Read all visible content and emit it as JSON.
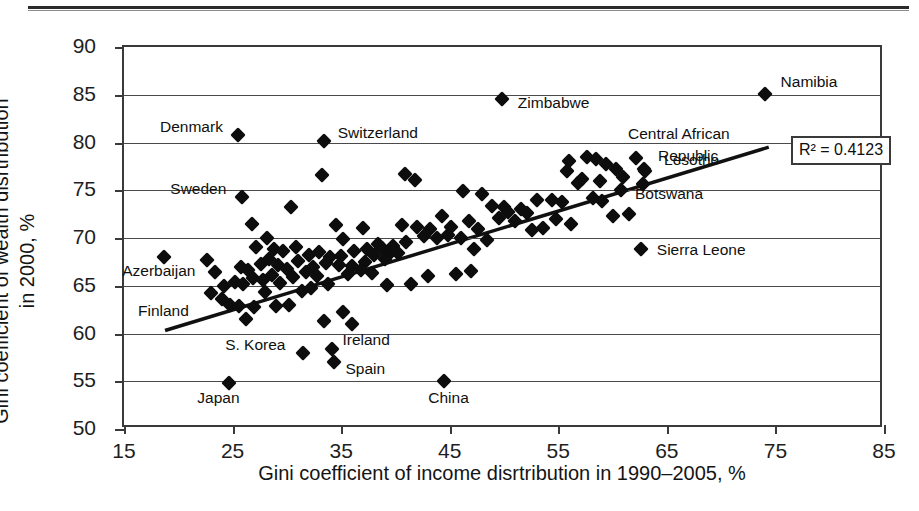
{
  "chart_data": {
    "type": "scatter",
    "title": "",
    "xlabel": "Gini coefficient of income disrtribution in 1990–2005, %",
    "ylabel": "Gini coefficient of wealth disrtribution in 2000, %",
    "xlim": [
      15,
      85
    ],
    "ylim": [
      50,
      90
    ],
    "xticks": [
      15,
      25,
      35,
      45,
      55,
      65,
      75,
      85
    ],
    "yticks": [
      50,
      55,
      60,
      65,
      70,
      75,
      80,
      85,
      90
    ],
    "grid": "horizontal",
    "legend": "none",
    "marker": "black-diamond",
    "annotations": [
      {
        "text": "R² = 0.4123",
        "kind": "boxed-stat"
      }
    ],
    "trendline": {
      "type": "linear",
      "x0": 18.8,
      "y0": 60.0,
      "x1": 74.7,
      "y1": 79.4,
      "r_squared": 0.4123
    },
    "labeled_points": [
      {
        "label": "Denmark",
        "x": 25.5,
        "y": 80.8,
        "label_side": "left"
      },
      {
        "label": "Switzerland",
        "x": 33.4,
        "y": 80.2,
        "label_side": "right"
      },
      {
        "label": "Zimbabwe",
        "x": 49.8,
        "y": 84.6,
        "label_side": "right"
      },
      {
        "label": "Namibia",
        "x": 74.0,
        "y": 85.1,
        "label_side": "right"
      },
      {
        "label": "Central African",
        "x": 0,
        "y": 0,
        "label_side": "text-only"
      },
      {
        "label": "Republic",
        "x": 0,
        "y": 0,
        "label_side": "text-only"
      },
      {
        "label": "Sweden",
        "x": 25.9,
        "y": 74.3,
        "label_side": "left"
      },
      {
        "label": "Lesotho",
        "x": 62.9,
        "y": 77.2,
        "label_side": "right"
      },
      {
        "label": "Botswana",
        "x": 62.8,
        "y": 75.7,
        "label_side": "right"
      },
      {
        "label": "Azerbaijan",
        "x": 18.7,
        "y": 68.0,
        "label_side": "below"
      },
      {
        "label": "Sierra Leone",
        "x": 62.6,
        "y": 68.9,
        "label_side": "right"
      },
      {
        "label": "Finland",
        "x": 0,
        "y": 0,
        "label_side": "text-only"
      },
      {
        "label": "S. Korea",
        "x": 31.5,
        "y": 58.0,
        "label_side": "left"
      },
      {
        "label": "Ireland",
        "x": 34.2,
        "y": 58.4,
        "label_side": "right"
      },
      {
        "label": "Spain",
        "x": 34.3,
        "y": 57.0,
        "label_side": "right"
      },
      {
        "label": "Japan",
        "x": 24.7,
        "y": 54.8,
        "label_side": "below"
      },
      {
        "label": "China",
        "x": 44.5,
        "y": 55.0,
        "label_side": "below"
      }
    ],
    "points": [
      [
        25.5,
        80.8
      ],
      [
        33.4,
        80.2
      ],
      [
        49.8,
        84.6
      ],
      [
        74.0,
        85.1
      ],
      [
        25.9,
        74.3
      ],
      [
        18.7,
        68.0
      ],
      [
        62.9,
        77.2
      ],
      [
        62.8,
        75.7
      ],
      [
        62.6,
        68.9
      ],
      [
        31.5,
        58.0
      ],
      [
        34.2,
        58.4
      ],
      [
        34.3,
        57.0
      ],
      [
        24.7,
        54.8
      ],
      [
        44.5,
        55.0
      ],
      [
        33.2,
        76.6
      ],
      [
        40.9,
        76.7
      ],
      [
        41.8,
        76.1
      ],
      [
        56.0,
        78.1
      ],
      [
        57.6,
        78.5
      ],
      [
        58.5,
        78.3
      ],
      [
        59.4,
        77.8
      ],
      [
        60.3,
        77.2
      ],
      [
        62.2,
        78.4
      ],
      [
        63.0,
        77.0
      ],
      [
        30.4,
        73.2
      ],
      [
        26.8,
        71.5
      ],
      [
        34.5,
        71.4
      ],
      [
        37.0,
        71.0
      ],
      [
        44.3,
        72.3
      ],
      [
        46.2,
        74.9
      ],
      [
        48.0,
        74.6
      ],
      [
        48.9,
        73.4
      ],
      [
        50.4,
        72.7
      ],
      [
        51.6,
        73.0
      ],
      [
        53.0,
        74.0
      ],
      [
        54.4,
        74.0
      ],
      [
        55.3,
        73.8
      ],
      [
        56.8,
        75.8
      ],
      [
        57.2,
        76.2
      ],
      [
        58.2,
        74.2
      ],
      [
        59.0,
        73.9
      ],
      [
        28.2,
        70.0
      ],
      [
        35.2,
        69.9
      ],
      [
        38.4,
        69.4
      ],
      [
        39.8,
        69.2
      ],
      [
        40.6,
        71.4
      ],
      [
        42.0,
        71.2
      ],
      [
        43.2,
        70.9
      ],
      [
        45.1,
        71.2
      ],
      [
        46.8,
        71.8
      ],
      [
        47.6,
        70.9
      ],
      [
        49.5,
        72.1
      ],
      [
        52.1,
        72.6
      ],
      [
        54.8,
        72.0
      ],
      [
        56.2,
        71.5
      ],
      [
        60.0,
        72.3
      ],
      [
        61.5,
        72.5
      ],
      [
        27.2,
        69.1
      ],
      [
        28.8,
        68.9
      ],
      [
        29.6,
        68.6
      ],
      [
        30.8,
        69.1
      ],
      [
        32.0,
        68.2
      ],
      [
        33.0,
        68.5
      ],
      [
        34.0,
        68.0
      ],
      [
        35.0,
        68.1
      ],
      [
        36.2,
        68.6
      ],
      [
        37.4,
        68.8
      ],
      [
        38.8,
        69.0
      ],
      [
        39.5,
        68.4
      ],
      [
        41.0,
        69.6
      ],
      [
        42.6,
        70.2
      ],
      [
        43.8,
        70.0
      ],
      [
        44.8,
        70.3
      ],
      [
        46.0,
        70.0
      ],
      [
        25.8,
        67.0
      ],
      [
        26.4,
        66.6
      ],
      [
        27.6,
        67.3
      ],
      [
        28.4,
        67.8
      ],
      [
        29.2,
        67.2
      ],
      [
        30.0,
        66.8
      ],
      [
        31.0,
        67.6
      ],
      [
        32.4,
        67.0
      ],
      [
        33.6,
        67.4
      ],
      [
        34.8,
        67.2
      ],
      [
        36.0,
        67.1
      ],
      [
        37.2,
        67.5
      ],
      [
        38.0,
        68.2
      ],
      [
        39.0,
        67.8
      ],
      [
        40.2,
        68.4
      ],
      [
        25.2,
        65.4
      ],
      [
        26.0,
        65.2
      ],
      [
        26.9,
        65.8
      ],
      [
        27.8,
        65.6
      ],
      [
        28.6,
        66.1
      ],
      [
        29.4,
        65.3
      ],
      [
        30.6,
        65.9
      ],
      [
        31.8,
        66.4
      ],
      [
        32.8,
        66.0
      ],
      [
        33.8,
        65.2
      ],
      [
        35.6,
        66.2
      ],
      [
        36.8,
        66.6
      ],
      [
        37.8,
        66.3
      ],
      [
        24.8,
        63.0
      ],
      [
        25.6,
        62.9
      ],
      [
        27.0,
        62.8
      ],
      [
        29.0,
        62.9
      ],
      [
        30.2,
        63.0
      ],
      [
        26.2,
        61.5
      ],
      [
        33.4,
        61.3
      ],
      [
        35.2,
        62.3
      ],
      [
        36.0,
        61.0
      ],
      [
        28.0,
        64.3
      ],
      [
        31.4,
        64.4
      ],
      [
        32.2,
        64.8
      ],
      [
        39.2,
        65.1
      ],
      [
        41.4,
        65.2
      ],
      [
        43.0,
        66.0
      ],
      [
        45.6,
        66.2
      ],
      [
        47.0,
        66.5
      ],
      [
        22.6,
        67.7
      ],
      [
        23.4,
        66.4
      ],
      [
        24.2,
        65.0
      ],
      [
        23.0,
        64.2
      ],
      [
        24.0,
        63.6
      ],
      [
        50.0,
        73.2
      ],
      [
        51.0,
        71.8
      ],
      [
        53.6,
        71.0
      ],
      [
        58.8,
        76.0
      ],
      [
        60.8,
        75.0
      ],
      [
        61.0,
        76.4
      ],
      [
        55.8,
        77.0
      ],
      [
        52.6,
        70.8
      ],
      [
        48.4,
        69.8
      ],
      [
        47.2,
        68.9
      ]
    ]
  },
  "axes": {
    "y_tick_labels": [
      "90",
      "85",
      "80",
      "75",
      "70",
      "65",
      "60",
      "55",
      "50"
    ],
    "x_tick_labels": [
      "15",
      "25",
      "35",
      "45",
      "55",
      "65",
      "75",
      "85"
    ],
    "y_title": "Gini coefficient of wealth disrtribution\nin 2000, %",
    "y_title_line1": "Gini coefficient of wealth disrtribution",
    "y_title_line2": "in 2000, %",
    "x_title": "Gini coefficient of income disrtribution in 1990–2005, %"
  },
  "r2": {
    "text": "R² = 0.4123"
  },
  "colors": {
    "marker": "#0d0d0d",
    "axis": "#3a3a3a",
    "grid": "#4a4a4a",
    "text": "#141414",
    "background": "#ffffff"
  }
}
